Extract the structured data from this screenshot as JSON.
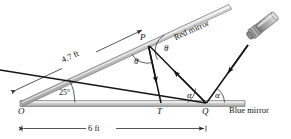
{
  "figure": {
    "labels": {
      "red_mirror": "Red mirror",
      "blue_mirror": "Blue mirror",
      "point_o": "O",
      "point_p": "P",
      "point_t": "T",
      "point_q": "Q",
      "angle_25": "25°",
      "theta_upper": "θ",
      "theta_lower": "θ",
      "alpha_left": "α",
      "alpha_right": "α",
      "dim_47": "4.7 ft",
      "dim_6": "6 ft"
    },
    "colors": {
      "mirror_fill": "#c9c9c9",
      "mirror_edge": "#6f6f6f",
      "mirror_highlight": "#efefef",
      "ray": "#141414",
      "dimension": "#2b2b2b",
      "flashlight_body": "#b4b4b4",
      "flashlight_shade": "#7c7c7c",
      "text": "#111111"
    },
    "geometry": {
      "o": [
        22,
        104
      ],
      "p": [
        148,
        44
      ],
      "t": [
        161,
        104
      ],
      "q": [
        206,
        104
      ],
      "red_mirror_angle_deg": 25,
      "red_mirror_length_ft": 4.7,
      "blue_mirror_span_ft": 6,
      "flashlight_tip": [
        251,
        44
      ]
    }
  }
}
